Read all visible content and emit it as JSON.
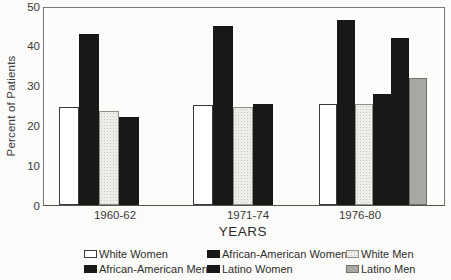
{
  "figure": {
    "kind": "scanned grouped bar chart figure"
  },
  "chart_data": {
    "type": "bar",
    "title": "",
    "xlabel": "YEARS",
    "ylabel": "Percent of Patients",
    "ylim": [
      0,
      50
    ],
    "yticks": [
      0,
      10,
      20,
      30,
      40,
      50
    ],
    "grid": false,
    "legend_position": "bottom",
    "categories": [
      "1960-62",
      "1971-74",
      "1976-80"
    ],
    "series": [
      {
        "name": "White Women",
        "values": [
          24.5,
          25,
          25.5
        ],
        "fill": "#ffffff",
        "stroke": "#3a3a38"
      },
      {
        "name": "African-American Women",
        "values": [
          43,
          45,
          46.5
        ],
        "fill": "#181816",
        "stroke": "#181816"
      },
      {
        "name": "White Men",
        "values": [
          23.5,
          24.5,
          25.5
        ],
        "fill": "stipple",
        "stroke": "#8e8e8a"
      },
      {
        "name": "African-American Men",
        "values": [
          22,
          25.5,
          28
        ],
        "fill": "#181816",
        "stroke": "#181816"
      },
      {
        "name": "Latino Women",
        "values": [
          null,
          null,
          42
        ],
        "fill": "#181816",
        "stroke": "#181816"
      },
      {
        "name": "Latino Men",
        "values": [
          null,
          null,
          32
        ],
        "fill": "#a9a9a3",
        "stroke": "#6f6f6b"
      }
    ]
  }
}
